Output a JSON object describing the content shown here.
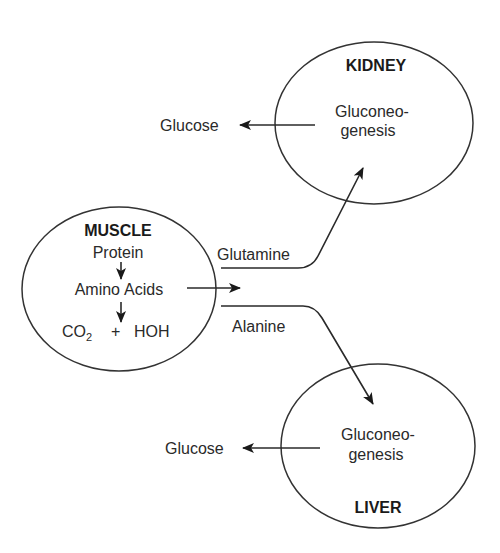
{
  "nodes": {
    "kidney": {
      "title": "KIDNEY",
      "process_line1": "Gluconeo-",
      "process_line2": "genesis",
      "output": "Glucose"
    },
    "muscle": {
      "title": "MUSCLE",
      "line1": "Protein",
      "line2_a": "Amino",
      "line2_b": "Acids",
      "line3_a": "CO",
      "line3_sub": "2",
      "line3_b": "+",
      "line3_c": "HOH"
    },
    "liver": {
      "title": "LIVER",
      "process_line1": "Gluconeo-",
      "process_line2": "genesis",
      "output": "Glucose"
    }
  },
  "edges": {
    "glutamine": "Glutamine",
    "alanine": "Alanine"
  }
}
